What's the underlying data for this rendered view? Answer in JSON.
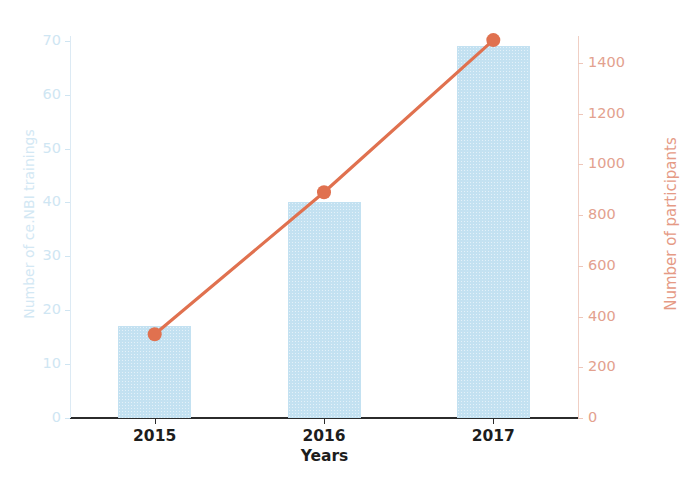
{
  "chart_data": {
    "type": "bar",
    "title": "",
    "categories": [
      "2015",
      "2016",
      "2017"
    ],
    "xlabel": "Years",
    "series": [
      {
        "name": "Number of ce.NBI trainings",
        "type": "bar",
        "axis": "left",
        "values": [
          17,
          40,
          69
        ],
        "color": "#c3e1f1"
      },
      {
        "name": "Number of participants",
        "type": "line",
        "axis": "right",
        "values": [
          330,
          890,
          1490
        ],
        "color": "#e0714f"
      }
    ],
    "left_axis": {
      "label": "Number of ce.NBI trainings",
      "ticks": [
        0,
        10,
        20,
        30,
        40,
        50,
        60,
        70
      ],
      "ylim": [
        0,
        72
      ],
      "color": "#cfe6f3"
    },
    "right_axis": {
      "label": "Number of participants",
      "ticks": [
        0,
        200,
        400,
        600,
        800,
        1000,
        1200,
        1400
      ],
      "ylim": [
        0,
        1530
      ],
      "color": "#e3a18e"
    },
    "grid": false,
    "legend": "none"
  },
  "colors": {
    "bar_fill": "#c3e1f1",
    "line": "#e0714f",
    "marker": "#e0714f",
    "axis_x": "#2b2b2b",
    "left_tick_text": "#cfe6f3",
    "right_tick_text": "#e3a18e",
    "background": "#ffffff"
  }
}
